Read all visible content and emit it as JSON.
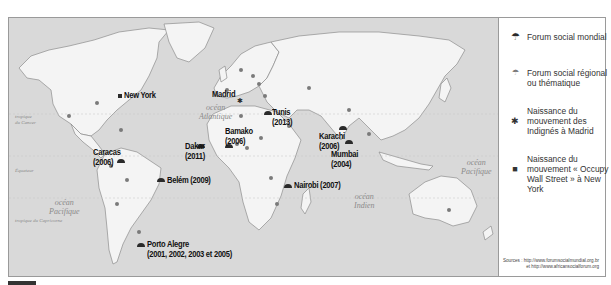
{
  "map": {
    "oceans": [
      {
        "id": "atlantic",
        "lines": [
          "océan",
          "Atlantique"
        ]
      },
      {
        "id": "pacific-west",
        "lines": [
          "océan",
          "Pacifique"
        ]
      },
      {
        "id": "pacific-east",
        "lines": [
          "océan",
          "Pacifique"
        ]
      },
      {
        "id": "indian",
        "lines": [
          "océan",
          "Indien"
        ]
      }
    ],
    "latitudes": {
      "cancer": [
        "tropique",
        "du Cancer"
      ],
      "equator": "Équateur",
      "capricorn": "tropique du Capricorne"
    },
    "cities": [
      {
        "name": "New York",
        "years": "",
        "type": "occupy"
      },
      {
        "name": "Madrid",
        "years": "",
        "type": "indignes"
      },
      {
        "name": "Tunis",
        "years": "(2013)",
        "type": "world"
      },
      {
        "name": "Karachi",
        "years": "(2006)",
        "type": "world"
      },
      {
        "name": "Mumbai",
        "years": "(2004)",
        "type": "world"
      },
      {
        "name": "Caracas",
        "years": "(2006)",
        "type": "world"
      },
      {
        "name": "Dakar",
        "years": "(2011)",
        "type": "world"
      },
      {
        "name": "Bamako",
        "years": "(2006)",
        "type": "world"
      },
      {
        "name": "Belém",
        "years": "(2009)",
        "type": "world"
      },
      {
        "name": "Nairobi",
        "years": "(2007)",
        "type": "world"
      },
      {
        "name": "Porto Alegre",
        "years": "(2001, 2002, 2003 et 2005)",
        "type": "world"
      }
    ]
  },
  "legend": {
    "items": [
      {
        "symbol": "world-forum-icon",
        "glyph": "☂",
        "label": "Forum social mondial"
      },
      {
        "symbol": "regional-forum-icon",
        "glyph": "☂",
        "label": "Forum social régional ou thématique"
      },
      {
        "symbol": "asterisk-icon",
        "glyph": "✱",
        "label": "Naissance du mouvement des Indignés à Madrid"
      },
      {
        "symbol": "square-icon",
        "glyph": "■",
        "label": "Naissance du mouvement « Occupy Wall Street » à New York"
      }
    ],
    "sources": "Sources : http://www.forumsocialmundial.org.br et http://www.africansocialforum.org"
  },
  "colors": {
    "sea": "#d9d9d9",
    "land": "#f4f4f4",
    "border": "#8c8c8c",
    "marker": "#2a2a2a",
    "marker_small": "#7a7a7a"
  }
}
